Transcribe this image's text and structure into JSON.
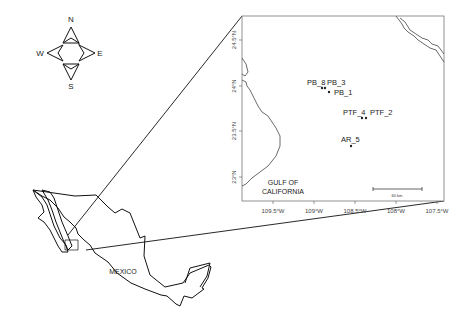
{
  "compass": {
    "north": "N",
    "south": "S",
    "east": "E",
    "west": "W"
  },
  "overview_map": {
    "country_label": "MEXICO"
  },
  "inset_map": {
    "region_label_line1": "GULF OF",
    "region_label_line2": "CALIFORNIA",
    "scale_bar_label": "60 km",
    "y_axis_ticks": [
      "24.5°N",
      "24°N",
      "23.5°N",
      "23°N"
    ],
    "x_axis_ticks": [
      "109.5°W",
      "109°W",
      "108.5°W",
      "108°W",
      "107.5°W"
    ],
    "stations": [
      {
        "name": "PB_8",
        "label": "PB_8"
      },
      {
        "name": "PB_3",
        "label": "PB_3"
      },
      {
        "name": "PB_1",
        "label": "PB_1"
      },
      {
        "name": "PTF_4",
        "label": "PTF_4"
      },
      {
        "name": "PTF_2",
        "label": "PTF_2"
      },
      {
        "name": "AR_5",
        "label": "AR_5"
      }
    ]
  },
  "colors": {
    "line": "#111111",
    "coast": "#444444",
    "background": "#ffffff"
  }
}
